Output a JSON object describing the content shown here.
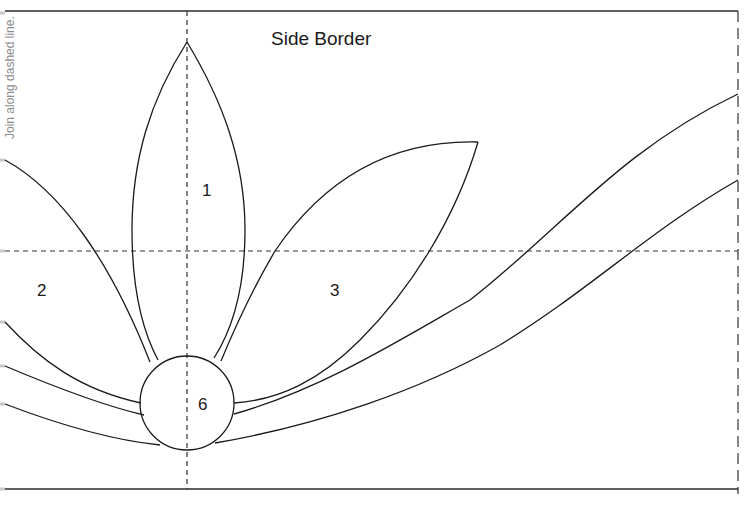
{
  "pattern": {
    "title": "Side Border",
    "side_note": "Join along dashed line.",
    "piece_labels": [
      {
        "id": "1",
        "text": "1"
      },
      {
        "id": "2",
        "text": "2"
      },
      {
        "id": "3",
        "text": "3"
      },
      {
        "id": "6",
        "text": "6"
      }
    ]
  },
  "colors": {
    "line": "#1a1a1a",
    "dashed": "#333333",
    "note_text": "#8a8a8a",
    "background": "#ffffff"
  }
}
